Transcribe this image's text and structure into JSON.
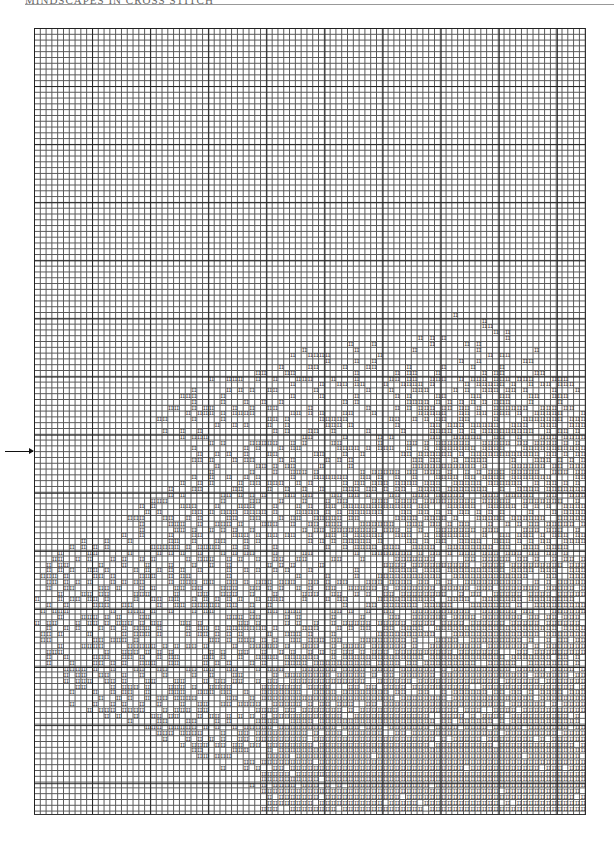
{
  "header": {
    "title": "MINDSCAPES IN CROSS STITCH"
  },
  "chart": {
    "columns": 95,
    "rows": 135,
    "symbol": "II",
    "center_marker_row": 73,
    "region_rows": [
      [
        48,
        73,
        78
      ],
      [
        50,
        70,
        80
      ],
      [
        52,
        68,
        84
      ],
      [
        54,
        50,
        86
      ],
      [
        56,
        42,
        88
      ],
      [
        58,
        36,
        90
      ],
      [
        60,
        30,
        92
      ],
      [
        62,
        26,
        94
      ],
      [
        64,
        24,
        95
      ],
      [
        66,
        22,
        95
      ],
      [
        68,
        20,
        95
      ],
      [
        70,
        24,
        95
      ],
      [
        72,
        26,
        95
      ],
      [
        74,
        26,
        95
      ],
      [
        76,
        28,
        95
      ],
      [
        78,
        24,
        95
      ],
      [
        80,
        22,
        95
      ],
      [
        82,
        18,
        95
      ],
      [
        84,
        16,
        95
      ],
      [
        86,
        14,
        95
      ],
      [
        88,
        8,
        95
      ],
      [
        90,
        4,
        95
      ],
      [
        92,
        2,
        95
      ],
      [
        94,
        0,
        95
      ],
      [
        96,
        0,
        95
      ],
      [
        100,
        0,
        95
      ],
      [
        104,
        0,
        95
      ],
      [
        108,
        2,
        95
      ],
      [
        112,
        4,
        95
      ],
      [
        116,
        6,
        95
      ],
      [
        120,
        18,
        95
      ],
      [
        124,
        26,
        95
      ],
      [
        128,
        34,
        95
      ],
      [
        132,
        38,
        95
      ],
      [
        135,
        40,
        95
      ]
    ],
    "dense_rows": [
      [
        60,
        62,
        95
      ],
      [
        70,
        68,
        95
      ],
      [
        84,
        44,
        95
      ],
      [
        92,
        60,
        95
      ],
      [
        104,
        60,
        95
      ],
      [
        112,
        40,
        95
      ],
      [
        120,
        36,
        95
      ],
      [
        124,
        40,
        95
      ],
      [
        128,
        40,
        95
      ],
      [
        134,
        40,
        95
      ]
    ]
  },
  "markers": {
    "left_arrow": "center-row-arrow"
  }
}
